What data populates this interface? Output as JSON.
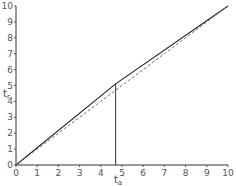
{
  "chart_data": {
    "type": "line",
    "title": "",
    "xlabel": "t_a",
    "ylabel": "t_r",
    "xlim": [
      0,
      10
    ],
    "ylim": [
      0,
      10
    ],
    "x_ticks": [
      "0",
      "1",
      "2",
      "3",
      "4",
      "5",
      "6",
      "7",
      "8",
      "9",
      "10"
    ],
    "y_ticks": [
      "0",
      "1",
      "2",
      "3",
      "4",
      "5",
      "6",
      "7",
      "8",
      "9",
      "10"
    ],
    "grid": false,
    "series": [
      {
        "name": "t_r vs t_a (solid)",
        "style": "solid",
        "x": [
          0,
          4.7,
          10
        ],
        "y": [
          0,
          5.1,
          10
        ]
      },
      {
        "name": "diagonal t_r = t_a (dashed)",
        "style": "dashed",
        "x": [
          0,
          10
        ],
        "y": [
          0,
          10
        ]
      }
    ],
    "annotations": [
      {
        "type": "vertical-line",
        "x": 4.7,
        "y_from": 0,
        "y_to": 5.1
      }
    ]
  },
  "labels": {
    "xlabel_main": "t",
    "xlabel_sub": "a",
    "ylabel_main": "t",
    "ylabel_sub": "r"
  }
}
